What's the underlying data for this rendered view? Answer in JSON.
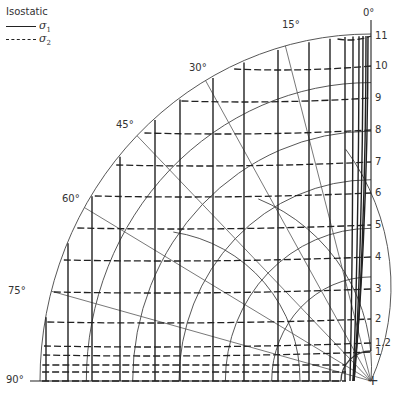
{
  "legend": {
    "title": "Isostatic",
    "items": [
      {
        "style": "solid",
        "symbol": "σ",
        "subscript": "1"
      },
      {
        "style": "dashed",
        "symbol": "σ",
        "subscript": "2"
      }
    ]
  },
  "angle_labels": [
    {
      "text": "0°",
      "angle": 0
    },
    {
      "text": "15°",
      "angle": 15
    },
    {
      "text": "30°",
      "angle": 30
    },
    {
      "text": "45°",
      "angle": 45
    },
    {
      "text": "60°",
      "angle": 60
    },
    {
      "text": "75°",
      "angle": 75
    },
    {
      "text": "90°",
      "angle": 90
    }
  ],
  "scale_labels": [
    {
      "text": "11",
      "y": 36
    },
    {
      "text": "10",
      "y": 66
    },
    {
      "text": "9",
      "y": 98
    },
    {
      "text": "8",
      "y": 130
    },
    {
      "text": "7",
      "y": 162
    },
    {
      "text": "6",
      "y": 193
    },
    {
      "text": "5",
      "y": 225
    },
    {
      "text": "4",
      "y": 257
    },
    {
      "text": "3",
      "y": 289
    },
    {
      "text": "2",
      "y": 319
    },
    {
      "text": "1.2",
      "y": 343
    },
    {
      "text": "1",
      "y": 352
    }
  ],
  "center_marker": "+",
  "colors": {
    "ink": "#222222",
    "thin": "#444444",
    "background": "#ffffff"
  }
}
